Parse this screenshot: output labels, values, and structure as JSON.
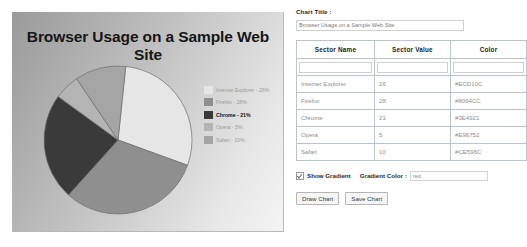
{
  "chart_panel": {
    "title": "Browser Usage on a Sample Web Site"
  },
  "form": {
    "chart_title_label": "Chart Title :",
    "chart_title_value": "Browser Usage on a Sample Web Site",
    "table": {
      "headers": [
        "Sector Name",
        "Sector Value",
        "Color"
      ],
      "new_row": {
        "name": "",
        "value": "",
        "color": ""
      },
      "rows": [
        {
          "name": "Internet Explorer",
          "value": "26",
          "color": "#ECD10C"
        },
        {
          "name": "Firefox",
          "value": "28",
          "color": "#8064CC"
        },
        {
          "name": "Chrome",
          "value": "21",
          "color": "#3E4921"
        },
        {
          "name": "Opera",
          "value": "5",
          "color": "#E96752"
        },
        {
          "name": "Safari",
          "value": "10",
          "color": "#CE596C"
        }
      ]
    },
    "show_gradient_label": "Show Gradient",
    "show_gradient_checked": true,
    "gradient_color_label": "Gradient Color :",
    "gradient_color_value": "red",
    "draw_button": "Draw Chart",
    "save_button": "Save Chart"
  },
  "legend": {
    "entries": [
      {
        "label": "Internet Explorer - 26%",
        "swatch": "#e6e6e6",
        "emphasis": false
      },
      {
        "label": "Firefox - 28%",
        "swatch": "#8f8f8f",
        "emphasis": false
      },
      {
        "label": "Chrome - 21%",
        "swatch": "#3a3a3a",
        "emphasis": true
      },
      {
        "label": "Opera - 5%",
        "swatch": "#b4b4b4",
        "emphasis": false
      },
      {
        "label": "Safari - 10%",
        "swatch": "#a5a5a5",
        "emphasis": false
      }
    ]
  },
  "chart_data": {
    "type": "pie",
    "title": "Browser Usage on a Sample Web Site",
    "categories": [
      "Internet Explorer",
      "Firefox",
      "Chrome",
      "Opera",
      "Safari"
    ],
    "values": [
      26,
      28,
      21,
      5,
      10
    ],
    "unit": "%",
    "colors": [
      "#ECD10C",
      "#8064CC",
      "#3E4921",
      "#E96752",
      "#CE596C"
    ],
    "rendered_colors": [
      "#e6e6e6",
      "#8f8f8f",
      "#3a3a3a",
      "#b4b4b4",
      "#a5a5a5"
    ],
    "legend": [
      "Internet Explorer - 26%",
      "Firefox - 28%",
      "Chrome - 21%",
      "Opera - 5%",
      "Safari - 10%"
    ],
    "legend_position": "right",
    "grid": false,
    "xlabel": "",
    "ylabel": ""
  }
}
